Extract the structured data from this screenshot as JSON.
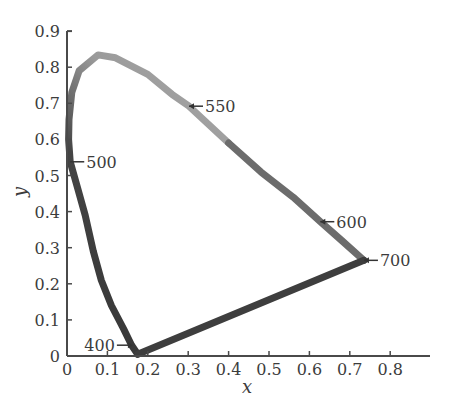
{
  "chart_data": {
    "type": "line",
    "title": "",
    "xlabel": "x",
    "ylabel": "y",
    "xlim": [
      0,
      0.9
    ],
    "ylim": [
      0,
      0.9
    ],
    "grid": false,
    "legend": null,
    "x_ticks": [
      "0",
      "0.1",
      "0.2",
      "0.3",
      "0.4",
      "0.5",
      "0.6",
      "0.7",
      "0.8"
    ],
    "y_ticks": [
      "0",
      "0.1",
      "0.2",
      "0.3",
      "0.4",
      "0.5",
      "0.6",
      "0.7",
      "0.8",
      "0.9"
    ],
    "series": [
      {
        "name": "spectral locus",
        "points": [
          [
            0.175,
            0.005
          ],
          [
            0.16,
            0.03
          ],
          [
            0.14,
            0.075
          ],
          [
            0.11,
            0.14
          ],
          [
            0.085,
            0.21
          ],
          [
            0.065,
            0.29
          ],
          [
            0.045,
            0.39
          ],
          [
            0.025,
            0.47
          ],
          [
            0.008,
            0.538
          ],
          [
            0.004,
            0.6
          ],
          [
            0.005,
            0.655
          ],
          [
            0.012,
            0.73
          ],
          [
            0.03,
            0.79
          ],
          [
            0.077,
            0.834
          ],
          [
            0.12,
            0.826
          ],
          [
            0.2,
            0.78
          ],
          [
            0.26,
            0.725
          ],
          [
            0.302,
            0.692
          ],
          [
            0.4,
            0.59
          ],
          [
            0.48,
            0.51
          ],
          [
            0.56,
            0.44
          ],
          [
            0.627,
            0.372
          ],
          [
            0.68,
            0.32
          ],
          [
            0.735,
            0.265
          ]
        ]
      },
      {
        "name": "line of purples",
        "points": [
          [
            0.735,
            0.265
          ],
          [
            0.175,
            0.005
          ]
        ]
      }
    ],
    "annotations": [
      {
        "label": "400",
        "x": 0.173,
        "y": 0.005,
        "side": "left"
      },
      {
        "label": "500",
        "x": 0.008,
        "y": 0.538,
        "side": "right"
      },
      {
        "label": "550",
        "x": 0.302,
        "y": 0.692,
        "side": "right"
      },
      {
        "label": "600",
        "x": 0.627,
        "y": 0.372,
        "side": "right"
      },
      {
        "label": "700",
        "x": 0.735,
        "y": 0.265,
        "side": "right"
      }
    ]
  },
  "axes": {
    "x_title": "x",
    "y_title": "y"
  },
  "colors": {
    "axis": "#4a4a4a",
    "text": "#3c3c3c",
    "locus_dark": "#3a3a3a",
    "locus_mid": "#7a7a7a",
    "locus_light": "#a9a9a9"
  }
}
